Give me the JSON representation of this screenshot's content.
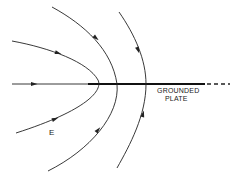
{
  "diagram": {
    "type": "electric-field-lines",
    "colors": {
      "background": "#ffffff",
      "line": "#222222",
      "plate": "#111111"
    },
    "labels": {
      "field": "E",
      "plate_line1": "GROUNDED",
      "plate_line2": "PLATE"
    },
    "axis_line": {
      "x1": 12,
      "y": 84,
      "x2": 88
    },
    "plate": {
      "x1": 88,
      "x2": 205,
      "y": 84,
      "dashed_extension": [
        207,
        230
      ]
    },
    "field_lines": [
      {
        "name": "field-line-inner",
        "path": "M12,41 C50,48 88,62 98,80 C103,90 88,110 16,133",
        "arrows": [
          {
            "x": 58,
            "y": 53,
            "angle": 18
          },
          {
            "x": 55,
            "y": 119,
            "angle": -20
          }
        ]
      },
      {
        "name": "field-line-middle",
        "path": "M52,7 C85,25 112,50 117,84 C120,115 90,150 48,171",
        "arrows": [
          {
            "x": 96,
            "y": 38,
            "angle": 40
          },
          {
            "x": 98,
            "y": 130,
            "angle": -50
          }
        ]
      },
      {
        "name": "field-line-outer",
        "path": "M119,12 C135,35 146,60 146,84 C146,115 130,145 117,168",
        "arrows": [
          {
            "x": 138,
            "y": 50,
            "angle": 70
          },
          {
            "x": 143,
            "y": 114,
            "angle": -75
          }
        ]
      }
    ],
    "axis_arrow": {
      "x": 34,
      "y": 84,
      "angle": 0
    }
  }
}
